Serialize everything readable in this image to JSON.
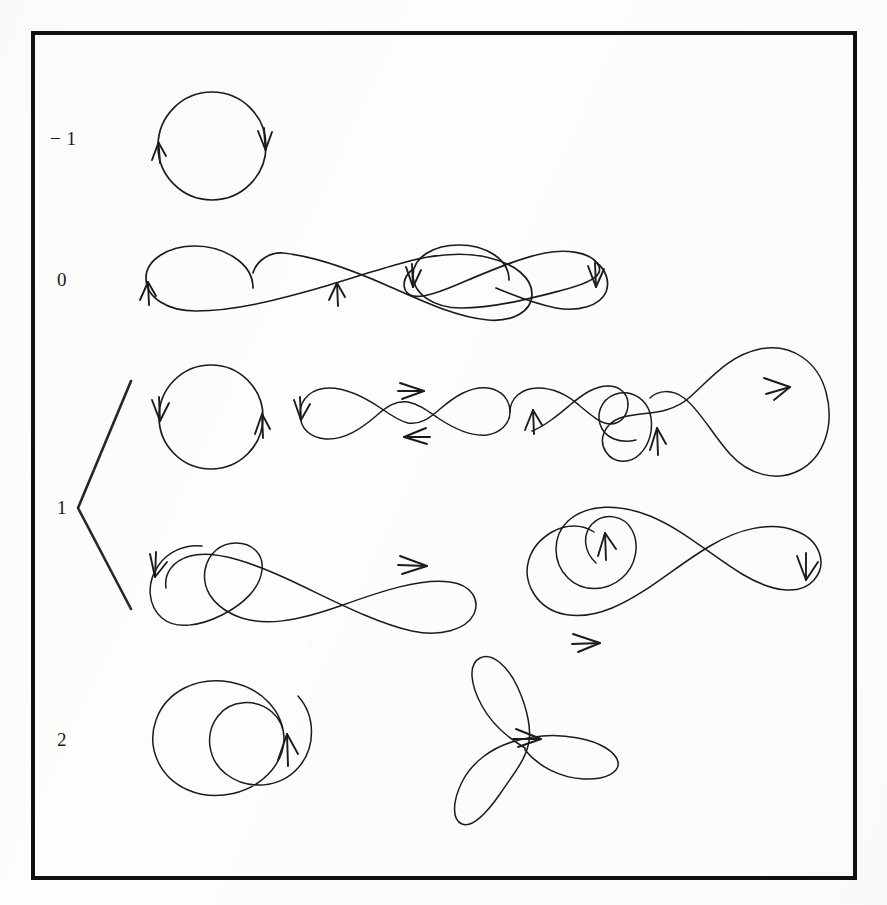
{
  "figure": {
    "kind": "mathematical-diagram",
    "background_color": "#fdfdfc",
    "ink_color": "#1b1b1b",
    "frame": {
      "name": "outer-frame",
      "x": 33,
      "y": 33,
      "width": 822,
      "height": 845,
      "stroke_width": 4,
      "color": "#111111"
    },
    "row_labels": [
      {
        "id": "row-label-minus1",
        "text": "− 1",
        "x": 50,
        "y": 139
      },
      {
        "id": "row-label-0",
        "text": "0",
        "x": 57,
        "y": 280
      },
      {
        "id": "row-label-1",
        "text": "1",
        "x": 57,
        "y": 508
      },
      {
        "id": "row-label-2",
        "text": "2",
        "x": 57,
        "y": 740
      }
    ],
    "brace": {
      "name": "row-1-brace",
      "shape": "angle-bracket",
      "apex_x": 78,
      "apex_y": 508,
      "top_x": 131,
      "top_y": 381,
      "bottom_x": 131,
      "bottom_y": 609,
      "stroke_width": 2.6
    },
    "rows": [
      {
        "id": "row-minus1",
        "label": "− 1",
        "curves": [
          {
            "id": "curve-circle-cw",
            "name": "circle-clockwise",
            "rotation_number": -1,
            "crossings": 0,
            "arrow_count": 2,
            "arrow_directions": [
              "up",
              "down"
            ]
          }
        ]
      },
      {
        "id": "row-0",
        "label": "0",
        "curves": [
          {
            "id": "curve-figure-eight-up",
            "name": "figure-eight-arrows-up",
            "rotation_number": 0,
            "crossings": 1,
            "arrow_count": 2,
            "arrow_directions": [
              "up",
              "up"
            ]
          },
          {
            "id": "curve-figure-eight-down",
            "name": "figure-eight-arrows-down",
            "rotation_number": 0,
            "crossings": 1,
            "arrow_count": 2,
            "arrow_directions": [
              "down",
              "down"
            ]
          }
        ]
      },
      {
        "id": "row-1",
        "label": "1",
        "curves": [
          {
            "id": "curve-circle-ccw",
            "name": "circle-counterclockwise",
            "rotation_number": 1,
            "crossings": 0,
            "arrow_count": 2,
            "arrow_directions": [
              "down",
              "up"
            ]
          },
          {
            "id": "curve-triple-loop",
            "name": "triple-loop-chain",
            "rotation_number": 1,
            "crossings": 2,
            "arrow_count": 4,
            "arrow_directions": [
              "down",
              "right",
              "left",
              "up"
            ]
          },
          {
            "id": "curve-double-small-loop",
            "name": "double-small-loop-with-big-arc",
            "rotation_number": 1,
            "crossings": 2,
            "arrow_count": 2,
            "arrow_directions": [
              "up",
              "right-down"
            ]
          },
          {
            "id": "curve-loop-in-eight-left",
            "name": "figure-eight-with-extra-loop",
            "rotation_number": 1,
            "crossings": 3,
            "arrow_count": 2,
            "arrow_directions": [
              "down-left",
              "right"
            ]
          },
          {
            "id": "curve-loop-in-eight-right",
            "name": "large-eight-with-inner-loop",
            "rotation_number": 1,
            "crossings": 3,
            "arrow_count": 3,
            "arrow_directions": [
              "up",
              "right",
              "down"
            ]
          }
        ]
      },
      {
        "id": "row-2",
        "label": "2",
        "curves": [
          {
            "id": "curve-limacon",
            "name": "limacon-inner-loop",
            "rotation_number": 2,
            "crossings": 1,
            "arrow_count": 1,
            "arrow_directions": [
              "up"
            ]
          },
          {
            "id": "curve-three-petal-rose",
            "name": "three-petal-rose",
            "rotation_number": 2,
            "crossings": 3,
            "arrow_count": 1,
            "arrow_directions": [
              "right"
            ]
          }
        ]
      }
    ]
  }
}
